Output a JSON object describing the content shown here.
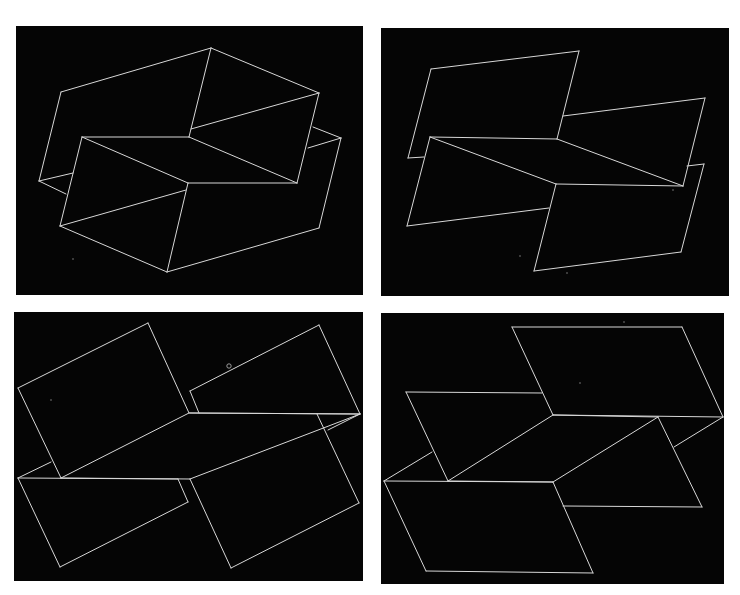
{
  "figure": {
    "background": "#ffffff",
    "panel_color": "#050505",
    "line_color": "#d8d8d8",
    "panels": [
      {
        "id": "top-left",
        "rect": [
          16,
          26,
          347,
          269
        ],
        "lines": [
          [
            61,
            92,
            211,
            48
          ],
          [
            211,
            48,
            319,
            93
          ],
          [
            319,
            93,
            297,
            183
          ],
          [
            297,
            183,
            188,
            183
          ],
          [
            188,
            183,
            82,
            137
          ],
          [
            82,
            137,
            189,
            137
          ],
          [
            189,
            137,
            211,
            48
          ],
          [
            189,
            137,
            297,
            183
          ],
          [
            61,
            92,
            39,
            181
          ],
          [
            39,
            181,
            73,
            173
          ],
          [
            39,
            181,
            66,
            194
          ],
          [
            319,
            93,
            191,
            129
          ],
          [
            313,
            127,
            341,
            138
          ],
          [
            341,
            138,
            319,
            228
          ],
          [
            341,
            138,
            308,
            148
          ],
          [
            319,
            228,
            167,
            272
          ],
          [
            167,
            272,
            60,
            226
          ],
          [
            60,
            226,
            82,
            137
          ],
          [
            167,
            272,
            188,
            183
          ],
          [
            60,
            226,
            186,
            190
          ]
        ],
        "specks": [
          [
            73,
            259
          ]
        ]
      },
      {
        "id": "top-right",
        "rect": [
          381,
          28,
          348,
          268
        ],
        "lines": [
          [
            431,
            69,
            579,
            51
          ],
          [
            579,
            51,
            557,
            139
          ],
          [
            431,
            69,
            408,
            158
          ],
          [
            408,
            158,
            424,
            157
          ],
          [
            563,
            116,
            705,
            98
          ],
          [
            705,
            98,
            683,
            186
          ],
          [
            430,
            137,
            557,
            139
          ],
          [
            557,
            139,
            683,
            186
          ],
          [
            683,
            186,
            556,
            184
          ],
          [
            556,
            184,
            430,
            137
          ],
          [
            430,
            137,
            407,
            226
          ],
          [
            407,
            226,
            549,
            208
          ],
          [
            556,
            184,
            534,
            271
          ],
          [
            534,
            271,
            681,
            252
          ],
          [
            681,
            252,
            704,
            164
          ],
          [
            704,
            164,
            687,
            166
          ]
        ],
        "specks": [
          [
            520,
            256
          ],
          [
            567,
            273
          ],
          [
            673,
            190
          ]
        ]
      },
      {
        "id": "bottom-left",
        "rect": [
          14,
          312,
          349,
          269
        ],
        "lines": [
          [
            18,
            388,
            148,
            323
          ],
          [
            148,
            323,
            189,
            413
          ],
          [
            18,
            388,
            61,
            478
          ],
          [
            190,
            391,
            319,
            325
          ],
          [
            319,
            325,
            360,
            414
          ],
          [
            190,
            391,
            199,
            413
          ],
          [
            190,
            413,
            360,
            414
          ],
          [
            61,
            478,
            189,
            413
          ],
          [
            189,
            413,
            360,
            414
          ],
          [
            360,
            414,
            190,
            479
          ],
          [
            61,
            478,
            190,
            479
          ],
          [
            18,
            478,
            60,
            567
          ],
          [
            60,
            567,
            188,
            502
          ],
          [
            18,
            478,
            178,
            479
          ],
          [
            18,
            478,
            51,
            462
          ],
          [
            178,
            479,
            188,
            502
          ],
          [
            190,
            479,
            231,
            568
          ],
          [
            231,
            568,
            359,
            503
          ],
          [
            359,
            503,
            317,
            414
          ],
          [
            328,
            430,
            360,
            414
          ]
        ],
        "marks": [
          [
            229,
            366,
            2.2
          ]
        ],
        "specks": [
          [
            51,
            400
          ]
        ]
      },
      {
        "id": "bottom-right",
        "rect": [
          381,
          313,
          343,
          271
        ],
        "lines": [
          [
            512,
            327,
            682,
            327
          ],
          [
            682,
            327,
            723,
            417
          ],
          [
            723,
            417,
            553,
            415
          ],
          [
            553,
            415,
            512,
            327
          ],
          [
            406,
            392,
            542,
            393
          ],
          [
            406,
            392,
            448,
            481
          ],
          [
            448,
            481,
            553,
            415
          ],
          [
            553,
            415,
            658,
            417
          ],
          [
            658,
            417,
            553,
            482
          ],
          [
            448,
            481,
            553,
            482
          ],
          [
            384,
            481,
            553,
            482
          ],
          [
            553,
            482,
            593,
            573
          ],
          [
            593,
            573,
            426,
            571
          ],
          [
            426,
            571,
            384,
            481
          ],
          [
            658,
            417,
            702,
            507
          ],
          [
            702,
            507,
            563,
            506
          ],
          [
            384,
            481,
            432,
            452
          ],
          [
            723,
            417,
            674,
            447
          ]
        ],
        "specks": [
          [
            624,
            322
          ],
          [
            580,
            383
          ]
        ]
      }
    ]
  }
}
